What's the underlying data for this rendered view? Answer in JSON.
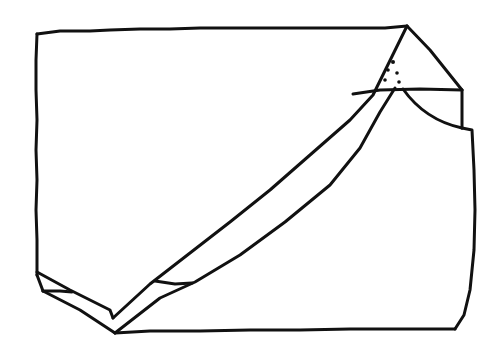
{
  "diagram": {
    "type": "hand-drawn line sketch",
    "stroke_color": "#111111",
    "background_color": "#ffffff",
    "labels": []
  }
}
